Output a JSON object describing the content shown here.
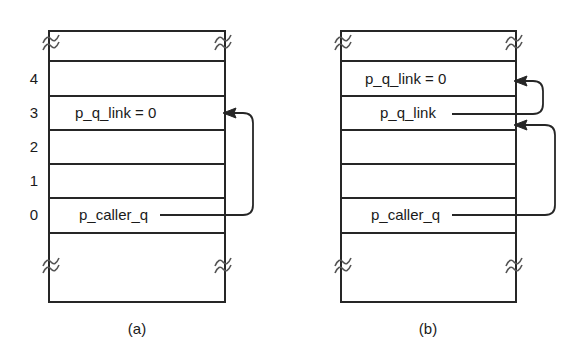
{
  "figure": {
    "title": "",
    "stroke_color": "#262626",
    "text_color": "#1a1a1a",
    "background": "#ffffff"
  },
  "panels": [
    {
      "id": "a",
      "caption": "(a)",
      "index_labels": [
        "4",
        "3",
        "2",
        "1",
        "0"
      ],
      "slots": [
        {
          "index": "4",
          "text": ""
        },
        {
          "index": "3",
          "text": "p_q_link = 0"
        },
        {
          "index": "2",
          "text": ""
        },
        {
          "index": "1",
          "text": ""
        },
        {
          "index": "0",
          "text": "p_caller_q"
        }
      ],
      "pointers": [
        {
          "from_slot": "0",
          "from_label": "p_caller_q",
          "to_slot": "3",
          "to_label": "p_q_link = 0"
        }
      ],
      "break_symbol": "~"
    },
    {
      "id": "b",
      "caption": "(b)",
      "index_labels": [],
      "slots": [
        {
          "index": "4",
          "text": "p_q_link = 0"
        },
        {
          "index": "3",
          "text": "p_q_link"
        },
        {
          "index": "2",
          "text": ""
        },
        {
          "index": "1",
          "text": ""
        },
        {
          "index": "0",
          "text": "p_caller_q"
        }
      ],
      "pointers": [
        {
          "from_slot": "3",
          "from_label": "p_q_link",
          "to_slot": "4",
          "to_label": "p_q_link = 0"
        },
        {
          "from_slot": "0",
          "from_label": "p_caller_q",
          "to_slot": "3",
          "to_label": "p_q_link"
        }
      ],
      "break_symbol": "~"
    }
  ]
}
